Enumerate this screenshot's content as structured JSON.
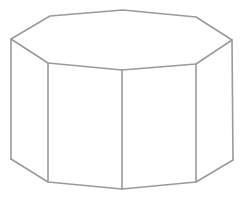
{
  "figure": {
    "shape": "octagonal prism",
    "background": "#ffffff",
    "stroke_color": "#9a9a9a",
    "stroke_width": 1.6,
    "top_face": [
      [
        50,
        16
      ],
      [
        123,
        10
      ],
      [
        196,
        17
      ],
      [
        232,
        40
      ],
      [
        196,
        64
      ],
      [
        122,
        70
      ],
      [
        48,
        63
      ],
      [
        11,
        39
      ]
    ],
    "visible_bottom": [
      [
        11,
        159
      ],
      [
        48,
        182
      ],
      [
        122,
        189
      ],
      [
        196,
        182
      ],
      [
        233,
        160
      ]
    ],
    "vertical_edges": [
      [
        [
          11,
          39
        ],
        [
          11,
          159
        ]
      ],
      [
        [
          48,
          63
        ],
        [
          48,
          182
        ]
      ],
      [
        [
          122,
          70
        ],
        [
          122,
          189
        ]
      ],
      [
        [
          196,
          64
        ],
        [
          196,
          182
        ]
      ],
      [
        [
          232,
          40
        ],
        [
          233,
          160
        ]
      ]
    ]
  }
}
